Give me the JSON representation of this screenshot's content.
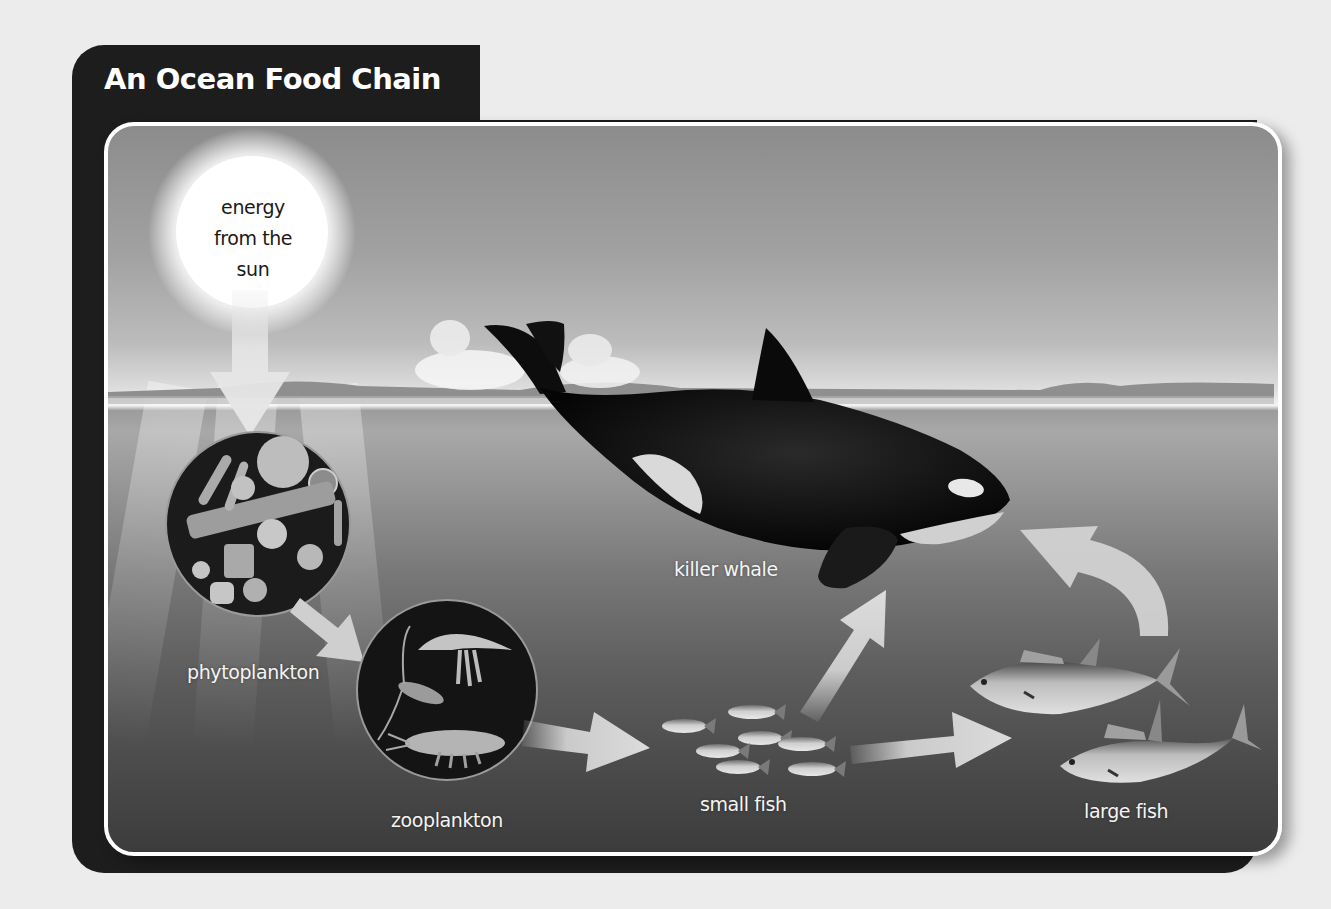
{
  "title": "An Ocean Food Chain",
  "sun": {
    "label_lines": [
      "energy",
      "from the",
      "sun"
    ]
  },
  "organisms": {
    "phytoplankton": "phytoplankton",
    "zooplankton": "zooplankton",
    "small_fish": "small fish",
    "large_fish": "large fish",
    "killer_whale": "killer whale"
  },
  "chain_flow": [
    {
      "from": "energy from the sun",
      "to": "phytoplankton"
    },
    {
      "from": "phytoplankton",
      "to": "zooplankton"
    },
    {
      "from": "zooplankton",
      "to": "small fish"
    },
    {
      "from": "small fish",
      "to": "large fish"
    },
    {
      "from": "small fish",
      "to": "killer whale"
    },
    {
      "from": "large fish",
      "to": "killer whale"
    }
  ],
  "colors": {
    "frame": "#1d1d1d",
    "panel_border": "#ffffff",
    "arrow": "#d9d9d9",
    "label": "#f4f4f4",
    "sun_text": "#1a1a1a"
  }
}
